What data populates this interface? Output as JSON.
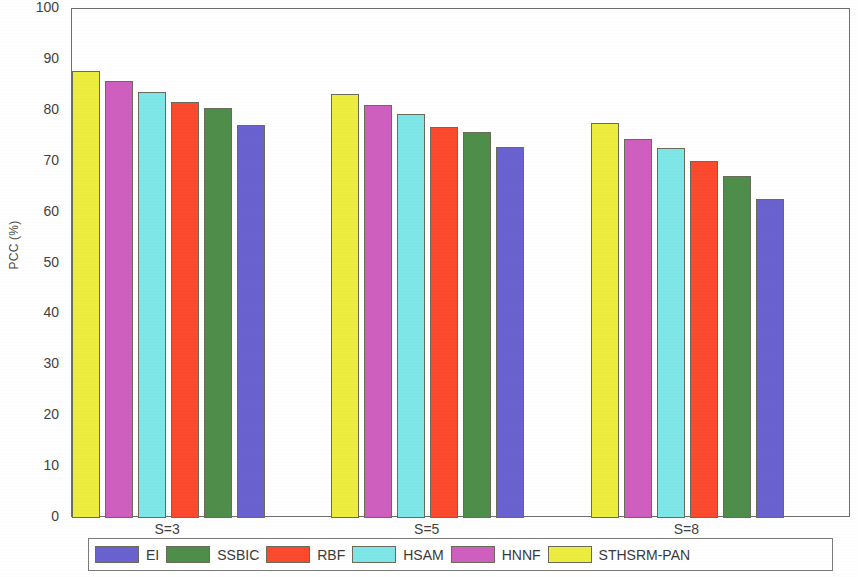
{
  "chart_data": {
    "type": "bar",
    "title": "",
    "xlabel": "",
    "ylabel": "PCC (%)",
    "categories": [
      "S=3",
      "S=5",
      "S=8"
    ],
    "ylim": [
      0,
      100
    ],
    "yticks": [
      0,
      10,
      20,
      30,
      40,
      50,
      60,
      70,
      80,
      90,
      100
    ],
    "grid": false,
    "legend_position": "bottom-outside",
    "bar_draw_order": [
      "STHSRM-PAN",
      "HNNF",
      "HSAM",
      "RBF",
      "SSBIC",
      "EI"
    ],
    "series": [
      {
        "name": "EI",
        "color": "#6a62cf",
        "values": [
          77.2,
          72.9,
          62.6
        ]
      },
      {
        "name": "SSBIC",
        "color": "#4f8e4a",
        "values": [
          80.5,
          75.8,
          67.2
        ]
      },
      {
        "name": "RBF",
        "color": "#fb4a2e",
        "values": [
          81.8,
          76.9,
          70.1
        ]
      },
      {
        "name": "HSAM",
        "color": "#7fe6e8",
        "values": [
          83.6,
          79.3,
          72.6
        ]
      },
      {
        "name": "HNNF",
        "color": "#cf5fbf",
        "values": [
          85.9,
          81.1,
          74.4
        ]
      },
      {
        "name": "STHSRM-PAN",
        "color": "#eded3f",
        "values": [
          87.8,
          83.3,
          77.6
        ]
      }
    ]
  },
  "legend": {
    "entries": [
      {
        "label": "EI",
        "color": "#6a62cf"
      },
      {
        "label": "SSBIC",
        "color": "#4f8e4a"
      },
      {
        "label": "RBF",
        "color": "#fb4a2e"
      },
      {
        "label": "HSAM",
        "color": "#7fe6e8"
      },
      {
        "label": "HNNF",
        "color": "#cf5fbf"
      },
      {
        "label": "STHSRM-PAN",
        "color": "#eded3f"
      }
    ]
  }
}
